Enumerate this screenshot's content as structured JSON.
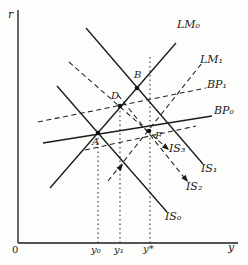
{
  "figure": {
    "background": "#fdfdfb",
    "ink": "#1b1b1b",
    "axis": {
      "r_label": "r",
      "y_label": "y",
      "origin_label": "0"
    },
    "axes": {
      "x_origin": 18,
      "y_base": 243,
      "y_top": 10,
      "x_right": 238
    },
    "x_ticks": [
      {
        "label": "y₀",
        "x": 98
      },
      {
        "label": "y₁",
        "x": 120
      },
      {
        "label": "y*",
        "x": 150
      }
    ],
    "guides": [
      {
        "x": 98,
        "y_top": 134
      },
      {
        "x": 120,
        "y_top": 107
      },
      {
        "x": 150,
        "y_top": 55
      }
    ],
    "curves": [
      {
        "id": "LM0",
        "label": "LM₀",
        "style": "solid",
        "x1": 50,
        "y1": 188,
        "x2": 176,
        "y2": 43
      },
      {
        "id": "LM1",
        "label": "LM₁",
        "style": "dashed",
        "x1": 108,
        "y1": 181,
        "x2": 202,
        "y2": 63
      },
      {
        "id": "BP1",
        "label": "BP₁",
        "style": "dashed",
        "x1": 38,
        "y1": 122,
        "x2": 206,
        "y2": 88
      },
      {
        "id": "BP0",
        "label": "BP₀",
        "style": "solid",
        "x1": 43,
        "y1": 143,
        "x2": 212,
        "y2": 116
      },
      {
        "id": "IS3",
        "label": "IS₃",
        "style": "dashed",
        "x1": 69,
        "y1": 62,
        "x2": 168,
        "y2": 149
      },
      {
        "id": "IS1",
        "label": "IS₁",
        "style": "solid",
        "x1": 86,
        "y1": 28,
        "x2": 203,
        "y2": 164
      },
      {
        "id": "IS2",
        "label": "IS₂",
        "style": "dashed",
        "x1": 118,
        "y1": 95,
        "x2": 187,
        "y2": 181
      },
      {
        "id": "IS0",
        "label": "IS₀",
        "style": "solid",
        "x1": 57,
        "y1": 86,
        "x2": 167,
        "y2": 212
      },
      {
        "id": "aux",
        "label": "",
        "style": "dashed",
        "x1": 85,
        "y1": 150,
        "x2": 196,
        "y2": 126
      }
    ],
    "points": [
      {
        "label": "A",
        "x": 98,
        "y": 133
      },
      {
        "label": "B",
        "x": 137,
        "y": 88
      },
      {
        "label": "D",
        "x": 120,
        "y": 106
      },
      {
        "label": "F",
        "x": 149,
        "y": 131
      }
    ],
    "arrows": [
      {
        "x": 123,
        "y": 164,
        "angle": -51
      },
      {
        "x": 169,
        "y": 150,
        "angle": 41
      },
      {
        "x": 188,
        "y": 182,
        "angle": 51
      }
    ]
  }
}
